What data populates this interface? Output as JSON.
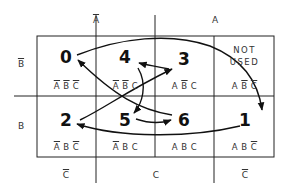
{
  "column_headers": {
    "not_a": {
      "text": "A",
      "overline": true
    },
    "a": {
      "text": "A",
      "overline": false
    }
  },
  "row_headers": {
    "not_b": {
      "text": "B",
      "overline": true
    },
    "b": {
      "text": "B",
      "overline": false
    }
  },
  "bottom_headers": [
    {
      "text": "C",
      "overline": true
    },
    {
      "text": "C",
      "overline": false
    },
    {
      "text": "C",
      "overline": true
    }
  ],
  "cells": [
    {
      "row": 0,
      "col": 0,
      "state": "0",
      "term": "A̅B̅C̅"
    },
    {
      "row": 0,
      "col": 1,
      "state": "4",
      "term": "A̅B̅C"
    },
    {
      "row": 0,
      "col": 2,
      "state": "3",
      "term": "AB̅C"
    },
    {
      "row": 0,
      "col": 3,
      "state": "NOT USED",
      "term": "AB̅C̅"
    },
    {
      "row": 1,
      "col": 0,
      "state": "2",
      "term": "A̅BC̅"
    },
    {
      "row": 1,
      "col": 1,
      "state": "5",
      "term": "A̅BC"
    },
    {
      "row": 1,
      "col": 2,
      "state": "6",
      "term": "ABC"
    },
    {
      "row": 1,
      "col": 3,
      "state": "1",
      "term": "ABC̅"
    }
  ],
  "not_used": {
    "line1": "NOT",
    "line2": "USED"
  },
  "transitions": [
    {
      "from": "0",
      "to": "1"
    },
    {
      "from": "1",
      "to": "2"
    },
    {
      "from": "2",
      "to": "3"
    },
    {
      "from": "3",
      "to": "4"
    },
    {
      "from": "4",
      "to": "5"
    },
    {
      "from": "5",
      "to": "6"
    },
    {
      "from": "6",
      "to": "0"
    }
  ]
}
